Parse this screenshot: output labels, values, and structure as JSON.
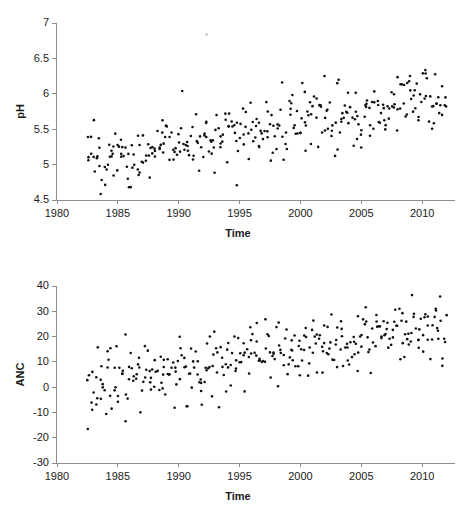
{
  "figure": {
    "background": "#ffffff",
    "point_color": "#111111",
    "axis_color": "#8d8d8d"
  },
  "chart_data": [
    {
      "type": "scatter",
      "id": "ph-panel",
      "title": "",
      "xlabel": "Time",
      "ylabel": "pH",
      "xlim": [
        1980,
        2012.7
      ],
      "ylim": [
        4.5,
        7
      ],
      "xticks": [
        1980,
        1985,
        1990,
        1995,
        2000,
        2005,
        2010
      ],
      "xticklabels": [
        "1980",
        "1985",
        "1990",
        "1995",
        "2000",
        "2005",
        "2010"
      ],
      "yticks": [
        4.5,
        5,
        5.5,
        6,
        6.5,
        7
      ],
      "yticklabels": [
        "4.5",
        "5",
        "5.5",
        "6",
        "6.5",
        "7"
      ],
      "grid": false,
      "legend": null,
      "marker": "filled-circle",
      "marker_size_px": 2.6,
      "n_points": 330,
      "description": "pH rises from about 5.1 in 1982 to about 5.9 in 2012 with scatter of roughly +/-0.35 pH units; low outliers near 4.5-4.7 in the 1980s and early 1990s, high outlier near 6.3 around 2000.",
      "series": [
        {
          "name": "pH",
          "trend_start_year": 1982.5,
          "trend_end_year": 2012.0,
          "trend_start_value": 5.09,
          "trend_end_value": 5.93,
          "scatter_sd_start": 0.205,
          "scatter_sd_end": 0.235,
          "seasonal_amplitude": 0.085,
          "clip": [
            4.5,
            6.35
          ]
        }
      ]
    },
    {
      "type": "scatter",
      "id": "anc-panel",
      "title": "",
      "xlabel": "Time",
      "ylabel": "ANC",
      "xlim": [
        1980,
        2012.7
      ],
      "ylim": [
        -30,
        40
      ],
      "xticks": [
        1980,
        1985,
        1990,
        1995,
        2000,
        2005,
        2010
      ],
      "xticklabels": [
        "1980",
        "1985",
        "1990",
        "1995",
        "2000",
        "2005",
        "2010"
      ],
      "yticks": [
        -30,
        -20,
        -10,
        0,
        10,
        20,
        30,
        40
      ],
      "yticklabels": [
        "-30",
        "-20",
        "-10",
        "0",
        "10",
        "20",
        "30",
        "40"
      ],
      "grid": false,
      "legend": null,
      "marker": "filled-circle",
      "marker_size_px": 2.6,
      "n_points": 330,
      "description": "ANC rises from about 2 in 1982 to about 25 in 2012 with scatter of roughly +/-8 units; low outliers near -20 to -29 in the 1980s, high values above 30 after 2008.",
      "series": [
        {
          "name": "ANC",
          "trend_start_year": 1982.5,
          "trend_end_year": 2012.0,
          "trend_start_value": 2.0,
          "trend_end_value": 24.8,
          "scatter_sd_start": 6.4,
          "scatter_sd_end": 6.0,
          "seasonal_amplitude": 2.4,
          "clip": [
            -29.5,
            36.5
          ]
        }
      ]
    }
  ]
}
